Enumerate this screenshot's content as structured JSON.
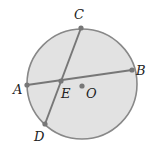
{
  "diagram": {
    "circle": {
      "cx": 82,
      "cy": 84,
      "r": 55,
      "fill": "#e2e2e2",
      "stroke": "#888888"
    },
    "chords": [
      {
        "from": "A",
        "to": "B"
      },
      {
        "from": "C",
        "to": "D"
      }
    ],
    "points": {
      "A": {
        "x": 27,
        "y": 85,
        "label": "A",
        "lx": 13,
        "ly": 94
      },
      "B": {
        "x": 132,
        "y": 70,
        "label": "B",
        "lx": 136,
        "ly": 75
      },
      "C": {
        "x": 81,
        "y": 28,
        "label": "C",
        "lx": 74,
        "ly": 19
      },
      "D": {
        "x": 45,
        "y": 124,
        "label": "D",
        "lx": 34,
        "ly": 141
      },
      "E": {
        "x": 61,
        "y": 81,
        "label": "E",
        "lx": 61,
        "ly": 98
      },
      "O": {
        "x": 82,
        "y": 86,
        "label": "O",
        "lx": 86,
        "ly": 98
      }
    },
    "line_color": "#777777",
    "point_color": "#777777"
  }
}
